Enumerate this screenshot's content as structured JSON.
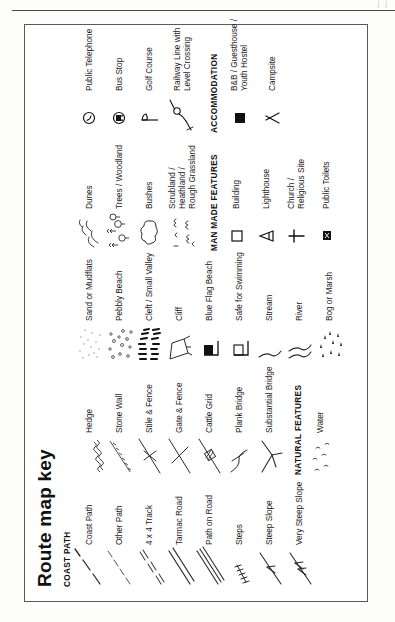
{
  "page": {
    "title": "Route map key",
    "corner_mark": "|   |",
    "ink_color": "#1a1a1a",
    "border_color": "#5a5a5a",
    "background_color": "#ffffff"
  },
  "columns": [
    {
      "id": "column-1",
      "blocks": [
        {
          "type": "section",
          "heading": "COAST PATH",
          "entries": [
            {
              "label": "Coast Path",
              "icon": "dashed-path-line"
            },
            {
              "label": "Other Path",
              "icon": "fine-dashed-path-line"
            },
            {
              "label": "4 x 4 Track",
              "icon": "double-dashed-track-line"
            },
            {
              "label": "Tarmac Road",
              "icon": "double-solid-road-line"
            },
            {
              "label": "Path on Road",
              "icon": "triple-solid-road-line"
            },
            {
              "label": "Steps",
              "icon": "steps-ladder"
            },
            {
              "label": "Steep Slope",
              "icon": "single-arrow-slope"
            },
            {
              "label": "Very Steep Slope",
              "icon": "double-arrow-slope"
            }
          ]
        }
      ]
    },
    {
      "id": "column-2",
      "blocks": [
        {
          "type": "section",
          "heading": "",
          "entries": [
            {
              "label": "Hedge",
              "icon": "hedge-squiggle-line"
            },
            {
              "label": "Stone Wall",
              "icon": "stone-wall-line"
            },
            {
              "label": "Stile & Fence",
              "icon": "stile-cross-fence"
            },
            {
              "label": "Gate & Fence",
              "icon": "gate-fence"
            },
            {
              "label": "Cattle Grid",
              "icon": "cattle-grid"
            },
            {
              "label": "Plank Bridge",
              "icon": "plank-bridge"
            },
            {
              "label": "Substantial Bridge",
              "icon": "substantial-bridge"
            }
          ]
        },
        {
          "type": "section",
          "heading": "NATURAL FEATURES",
          "entries": [
            {
              "label": "Water",
              "icon": "water-ripples"
            }
          ]
        }
      ]
    },
    {
      "id": "column-3",
      "blocks": [
        {
          "type": "section",
          "heading": "",
          "entries": [
            {
              "label": "Sand or Mudflats",
              "icon": "sand-stipple"
            },
            {
              "label": "Pebbly Beach",
              "icon": "pebble-scatter"
            },
            {
              "label": "Cleft / Small Valley",
              "icon": "cleft-hachures"
            },
            {
              "label": "Cliff",
              "icon": "cliff-outline"
            },
            {
              "label": "Blue Flag Beach",
              "icon": "filled-flag"
            },
            {
              "label": "Safe for Swimming",
              "icon": "outline-flag"
            },
            {
              "label": "Stream",
              "icon": "stream-single-line"
            },
            {
              "label": "River",
              "icon": "river-double-line"
            },
            {
              "label": "Bog or Marsh",
              "icon": "marsh-tufts"
            }
          ]
        }
      ]
    },
    {
      "id": "column-4",
      "blocks": [
        {
          "type": "section",
          "heading": "",
          "entries": [
            {
              "label": "Dunes",
              "icon": "dunes-curves"
            },
            {
              "label": "Trees / Woodland",
              "icon": "trees-woodland"
            },
            {
              "label": "Bushes",
              "icon": "bush-cloud"
            },
            {
              "label": "Scrubland /\nHeathland /\nRough Grassland",
              "icon": "scrub-tufts"
            }
          ]
        },
        {
          "type": "section",
          "heading": "MAN MADE FEATURES",
          "entries": [
            {
              "label": "Building",
              "icon": "building-square"
            },
            {
              "label": "Lighthouse",
              "icon": "lighthouse-symbol"
            },
            {
              "label": "Church /\nReligious Site",
              "icon": "cross-symbol"
            },
            {
              "label": "Public Toilets",
              "icon": "toilets-symbol"
            }
          ]
        }
      ]
    },
    {
      "id": "column-5",
      "blocks": [
        {
          "type": "section",
          "heading": "",
          "entries": [
            {
              "label": "Public Telephone",
              "icon": "telephone-symbol"
            },
            {
              "label": "Bus Stop",
              "icon": "bus-stop-symbol"
            },
            {
              "label": "Golf Course",
              "icon": "golf-flag-symbol"
            },
            {
              "label": "Railway Line with\nLevel Crossing",
              "icon": "railway-level-crossing"
            }
          ]
        },
        {
          "type": "section",
          "heading": "ACCOMMODATION",
          "entries": [
            {
              "label": "B&B / Guesthouse /\nYouth Hostel",
              "icon": "filled-square-accommodation"
            },
            {
              "label": "Campsite",
              "icon": "tent-symbol"
            }
          ]
        }
      ]
    }
  ]
}
